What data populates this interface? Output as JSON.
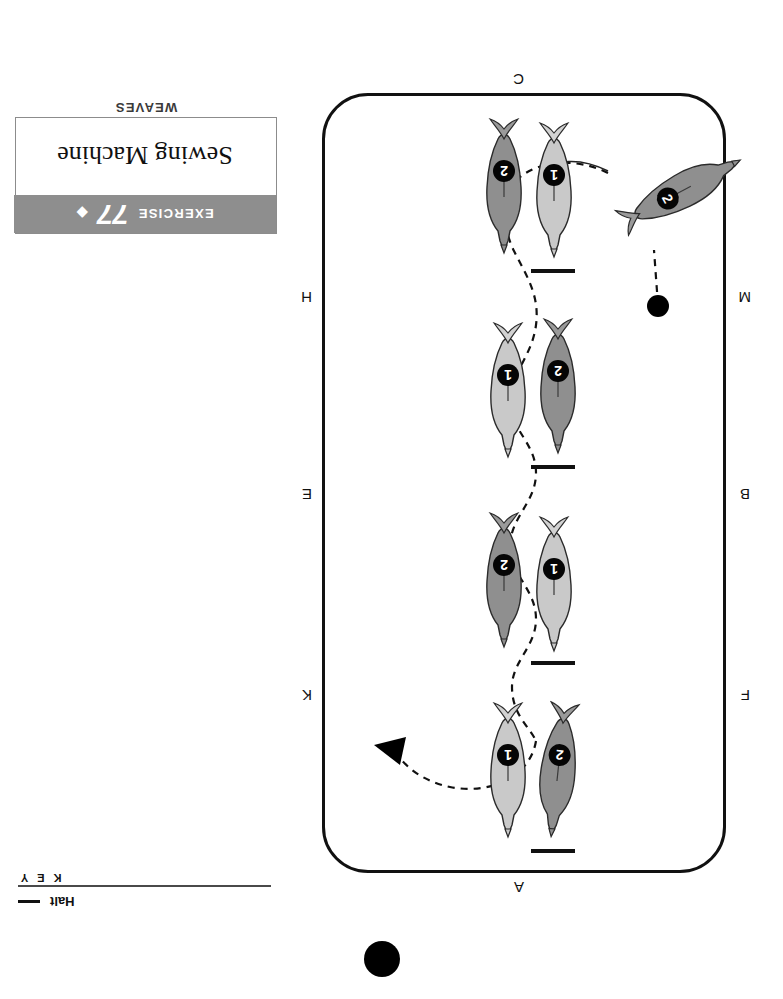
{
  "document": {
    "orientation": "upside-down",
    "page_marker": "filled-circle"
  },
  "key": {
    "title": "K E Y",
    "entries": [
      {
        "symbol": "—",
        "label": "Halt"
      }
    ]
  },
  "exercise": {
    "category": "EXERCISE",
    "number": "77",
    "diamond": "◆",
    "name": "Sewing Machine",
    "section": "WEAVES"
  },
  "arena": {
    "letters": [
      {
        "name": "A",
        "side": "top",
        "x": 202,
        "y": -22
      },
      {
        "name": "F",
        "side": "left",
        "x": -24,
        "y": 170
      },
      {
        "name": "B",
        "side": "left",
        "x": -24,
        "y": 371
      },
      {
        "name": "M",
        "side": "left",
        "x": -24,
        "y": 568
      },
      {
        "name": "C",
        "side": "bottom",
        "x": 202,
        "y": 786
      },
      {
        "name": "H",
        "side": "right",
        "x": 414,
        "y": 568
      },
      {
        "name": "E",
        "side": "right",
        "x": 414,
        "y": 371
      },
      {
        "name": "K",
        "side": "right",
        "x": 414,
        "y": 170
      }
    ],
    "start_dot": {
      "label": "start-point",
      "x": 57,
      "y": 556
    },
    "direction_arrow": {
      "label": "direction-of-travel",
      "points": "right"
    }
  },
  "figures": {
    "horse_colors": {
      "horse_1": "#c9c9c9",
      "horse_2": "#8f8f8f"
    },
    "pairs": [
      {
        "id": "pair-1",
        "halt": true,
        "horses": [
          {
            "number": "2",
            "shade": "dark",
            "x": 208,
            "y": 625,
            "rotate": -52
          },
          {
            "number": "1",
            "shade": "light",
            "x": 146,
            "y": 615,
            "rotate": 0
          },
          {
            "number": "2",
            "shade": "dark",
            "x": 196,
            "y": 615,
            "rotate": 0
          }
        ]
      },
      {
        "id": "pair-2",
        "halt": true,
        "horses": [
          {
            "number": "2",
            "shade": "dark",
            "x": 142,
            "y": 420,
            "rotate": 0
          },
          {
            "number": "1",
            "shade": "light",
            "x": 192,
            "y": 420,
            "rotate": 0
          }
        ]
      },
      {
        "id": "pair-3",
        "halt": true,
        "horses": [
          {
            "number": "1",
            "shade": "light",
            "x": 146,
            "y": 222,
            "rotate": 0
          },
          {
            "number": "2",
            "shade": "dark",
            "x": 196,
            "y": 222,
            "rotate": 0
          }
        ]
      },
      {
        "id": "pair-4",
        "halt": true,
        "horses": [
          {
            "number": "2",
            "shade": "dark",
            "x": 142,
            "y": 32,
            "rotate": 0
          },
          {
            "number": "1",
            "shade": "light",
            "x": 192,
            "y": 32,
            "rotate": 0
          }
        ]
      }
    ]
  }
}
